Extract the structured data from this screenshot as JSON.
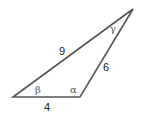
{
  "diagram": {
    "type": "triangle",
    "colors": {
      "stroke": "#555555",
      "label": "#222222",
      "angle": "#555555"
    },
    "vertices": {
      "left": [
        13,
        97
      ],
      "bottom_right": [
        80,
        97
      ],
      "top": [
        133,
        9
      ]
    },
    "sides": [
      {
        "id": "left-top",
        "label": "9"
      },
      {
        "id": "bottom-right-top",
        "label": "6"
      },
      {
        "id": "bottom",
        "label": "4"
      }
    ],
    "angles": [
      {
        "id": "beta",
        "label": "β",
        "vertex": "left"
      },
      {
        "id": "alpha",
        "label": "α",
        "vertex": "bottom_right"
      },
      {
        "id": "gamma",
        "label": "γ",
        "vertex": "top"
      }
    ]
  }
}
